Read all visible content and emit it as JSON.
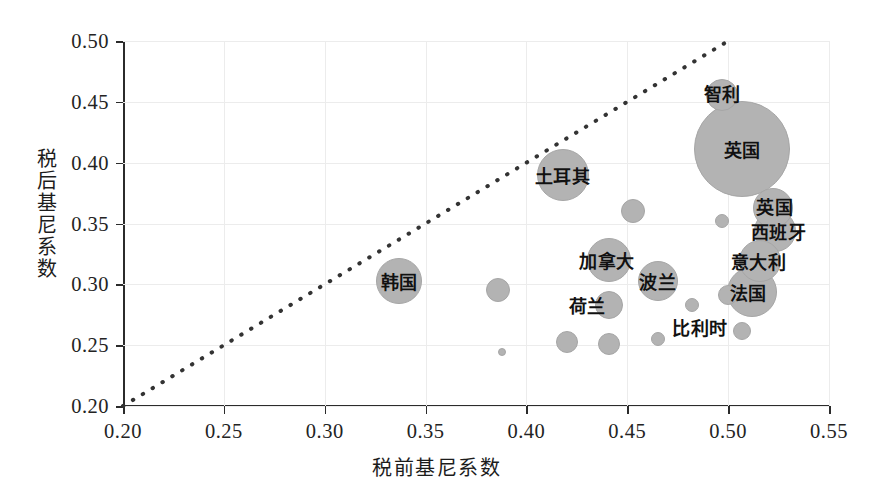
{
  "chart_data": {
    "type": "scatter",
    "title": "",
    "xlabel": "税前基尼系数",
    "ylabel": "税后基尼系数",
    "xlim": [
      0.2,
      0.55
    ],
    "ylim": [
      0.2,
      0.5
    ],
    "xticks": [
      "0.20",
      "0.25",
      "0.30",
      "0.35",
      "0.40",
      "0.45",
      "0.50",
      "0.55"
    ],
    "xtick_values": [
      0.2,
      0.25,
      0.3,
      0.35,
      0.4,
      0.45,
      0.5,
      0.55
    ],
    "yticks": [
      "0.20",
      "0.25",
      "0.30",
      "0.35",
      "0.40",
      "0.45",
      "0.50"
    ],
    "ytick_values": [
      0.2,
      0.25,
      0.3,
      0.35,
      0.4,
      0.45,
      0.5
    ],
    "grid": true,
    "legend": "none",
    "bubble_color": "#b3b3b3",
    "reference_line": {
      "style": "dotted",
      "color": "#333333",
      "x": [
        0.2,
        0.5
      ],
      "y": [
        0.2,
        0.5
      ],
      "note": "y = x 对角参考线"
    },
    "points": [
      {
        "label": "智利",
        "x": 0.497,
        "y": 0.456,
        "r": 16,
        "label_dx": 0,
        "label_dy": -2
      },
      {
        "label": "英国",
        "x": 0.507,
        "y": 0.411,
        "r": 48,
        "label_dx": 0,
        "label_dy": 0
      },
      {
        "label": "英国",
        "x": 0.522,
        "y": 0.363,
        "r": 20,
        "label_dx": 2,
        "label_dy": -2
      },
      {
        "label": "西班牙",
        "x": 0.523,
        "y": 0.344,
        "r": 21,
        "label_dx": 4,
        "label_dy": 0
      },
      {
        "label": "意大利",
        "x": 0.516,
        "y": 0.319,
        "r": 21,
        "label_dx": -2,
        "label_dy": 0
      },
      {
        "label": "法国",
        "x": 0.512,
        "y": 0.294,
        "r": 25,
        "label_dx": -4,
        "label_dy": 0
      },
      {
        "label": "土耳其",
        "x": 0.418,
        "y": 0.39,
        "r": 26,
        "label_dx": 0,
        "label_dy": 0
      },
      {
        "label": "韩国",
        "x": 0.337,
        "y": 0.303,
        "r": 23,
        "label_dx": 0,
        "label_dy": 0
      },
      {
        "label": "加拿大",
        "x": 0.441,
        "y": 0.32,
        "r": 22,
        "label_dx": -2,
        "label_dy": 0
      },
      {
        "label": "波兰",
        "x": 0.465,
        "y": 0.303,
        "r": 20,
        "label_dx": 0,
        "label_dy": 0
      },
      {
        "label": "荷兰",
        "x": 0.441,
        "y": 0.283,
        "r": 14,
        "label_dx": -22,
        "label_dy": 0
      },
      {
        "label": "比利时",
        "x": 0.482,
        "y": 0.283,
        "r": 7,
        "label_dx": 8,
        "label_dy": 22
      },
      {
        "label": "",
        "x": 0.453,
        "y": 0.36,
        "r": 12,
        "label_dx": 0,
        "label_dy": 0
      },
      {
        "label": "",
        "x": 0.386,
        "y": 0.295,
        "r": 12,
        "label_dx": 0,
        "label_dy": 0
      },
      {
        "label": "",
        "x": 0.497,
        "y": 0.352,
        "r": 7,
        "label_dx": 0,
        "label_dy": 0
      },
      {
        "label": "",
        "x": 0.5,
        "y": 0.291,
        "r": 10,
        "label_dx": 0,
        "label_dy": 0
      },
      {
        "label": "",
        "x": 0.42,
        "y": 0.253,
        "r": 11,
        "label_dx": 0,
        "label_dy": 0
      },
      {
        "label": "",
        "x": 0.441,
        "y": 0.251,
        "r": 11,
        "label_dx": 0,
        "label_dy": 0
      },
      {
        "label": "",
        "x": 0.465,
        "y": 0.255,
        "r": 7,
        "label_dx": 0,
        "label_dy": 0
      },
      {
        "label": "",
        "x": 0.388,
        "y": 0.244,
        "r": 4,
        "label_dx": 0,
        "label_dy": 0
      },
      {
        "label": "",
        "x": 0.507,
        "y": 0.262,
        "r": 9,
        "label_dx": 0,
        "label_dy": 0
      }
    ]
  }
}
